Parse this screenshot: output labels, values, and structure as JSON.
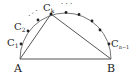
{
  "diagram": {
    "type": "semicircle-with-inscribed-triangle",
    "colors": {
      "stroke": "#555555",
      "point": "#222222",
      "text": "#222222"
    },
    "labels": {
      "A": "A",
      "B": "B",
      "C1": "C",
      "C1_sub": "1",
      "C2": "C",
      "C2_sub": "2",
      "Ck": "C",
      "Ck_sub": "k",
      "Cn1": "C",
      "Cn1_sub": "n−1",
      "dots_left": "· · ·",
      "dots_top": "· · ·"
    },
    "points": [
      {
        "name": "C1",
        "x": 21,
        "y": 44
      },
      {
        "name": "C2",
        "x": 28,
        "y": 31
      },
      {
        "name": "P3",
        "x": 38,
        "y": 20
      },
      {
        "name": "Ck",
        "x": 51,
        "y": 14
      },
      {
        "name": "P5",
        "x": 66,
        "y": 12
      },
      {
        "name": "P6",
        "x": 79,
        "y": 14
      },
      {
        "name": "P7",
        "x": 92,
        "y": 21
      },
      {
        "name": "P8",
        "x": 100,
        "y": 30
      },
      {
        "name": "Cn-1",
        "x": 109,
        "y": 44
      }
    ]
  }
}
